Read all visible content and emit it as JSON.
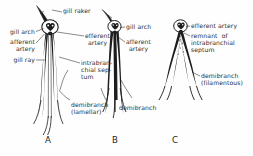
{
  "figure": {
    "background_color": "#fefefe",
    "ink_color": "#1d1d1d",
    "label_color": "#2b2b2b"
  },
  "panels": [
    {
      "letter": "A",
      "name": "panel-a"
    },
    {
      "letter": "B",
      "name": "panel-b"
    },
    {
      "letter": "C",
      "name": "panel-c"
    }
  ],
  "labels": {
    "gill_raker": "gill raker",
    "gill_arch_a": "gill arch",
    "afferent_artery_a_l1": "afferent",
    "afferent_artery_a_l2": "artery",
    "gill_ray": "gill ray",
    "efferent_artery_a_l1": "efferent",
    "efferent_artery_a_l2": "artery",
    "intrabranchial_septum_l1": "intrabran-",
    "intrabranchial_septum_l2": "chial sep-",
    "intrabranchial_septum_l3": "tum",
    "demibranch_lamellar_l1": "demibranch",
    "demibranch_lamellar_l2": "(lamellar)",
    "gill_arch_b": "gill arch",
    "afferent_artery_b_l1": "afferent",
    "afferent_artery_b_l2": "artery",
    "demibranch_b": "demibranch",
    "efferent_artery_c": "efferent artery",
    "remnant_l1": "remnant  of",
    "remnant_l2": "intrabranchial",
    "remnant_l3": "septum",
    "demibranch_filamentous_l1": "demibranch",
    "demibranch_filamentous_l2": "(filamentous)"
  }
}
